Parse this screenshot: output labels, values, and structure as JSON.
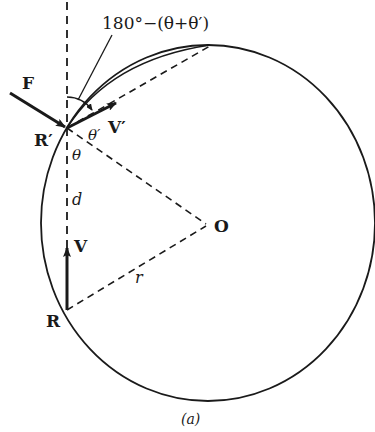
{
  "figure": {
    "caption": "(a)",
    "angle_label": "180°−(θ+θ′)",
    "labels": {
      "force": "F",
      "point_r_prime": "R′",
      "point_r": "R",
      "velocity_prime": "V′",
      "velocity": "V",
      "center": "O",
      "theta": "θ",
      "theta_prime": "θ′",
      "distance": "d",
      "radius": "r"
    },
    "colors": {
      "ink": "#1a1a1a",
      "background": "#ffffff"
    }
  }
}
